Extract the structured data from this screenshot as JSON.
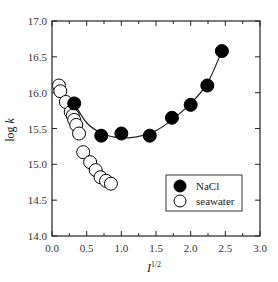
{
  "chart_data": {
    "type": "scatter",
    "title": "",
    "xlabel": "I^1/2",
    "xlabel_base": "I",
    "xlabel_sup": "1/2",
    "ylabel": "log k",
    "ylabel_base": "log ",
    "ylabel_italic": "k",
    "xlim": [
      0.0,
      3.0
    ],
    "ylim": [
      14.0,
      17.0
    ],
    "xticks": [
      "0.0",
      "0.5",
      "1.0",
      "1.5",
      "2.0",
      "2.5",
      "3.0"
    ],
    "yticks": [
      "14.0",
      "14.5",
      "15.0",
      "15.5",
      "16.0",
      "16.5",
      "17.0"
    ],
    "grid": false,
    "legend_position": "lower right",
    "series": [
      {
        "name": "NaCl",
        "marker": "filled-circle",
        "color": "#000000",
        "x": [
          0.32,
          0.71,
          1.0,
          1.41,
          1.73,
          2.0,
          2.24,
          2.45
        ],
        "y": [
          15.85,
          15.4,
          15.43,
          15.4,
          15.65,
          15.83,
          16.1,
          16.58
        ],
        "fit_curve": true
      },
      {
        "name": "seawater",
        "marker": "open-circle",
        "color": "#000000",
        "x": [
          0.1,
          0.12,
          0.2,
          0.27,
          0.3,
          0.32,
          0.35,
          0.39,
          0.45,
          0.55,
          0.63,
          0.7,
          0.78,
          0.85
        ],
        "y": [
          16.1,
          16.02,
          15.87,
          15.73,
          15.68,
          15.62,
          15.55,
          15.43,
          15.17,
          15.03,
          14.92,
          14.82,
          14.77,
          14.73
        ],
        "fit_curve": false
      }
    ],
    "fit_line": {
      "x": [
        0.32,
        0.5,
        0.7,
        0.9,
        1.1,
        1.3,
        1.5,
        1.73,
        2.0,
        2.24,
        2.45
      ],
      "y": [
        15.85,
        15.58,
        15.44,
        15.38,
        15.37,
        15.4,
        15.47,
        15.62,
        15.85,
        16.13,
        16.58
      ]
    }
  },
  "legend": {
    "items": [
      {
        "label": "NaCl",
        "marker": "filled"
      },
      {
        "label": "seawater",
        "marker": "open"
      }
    ]
  }
}
